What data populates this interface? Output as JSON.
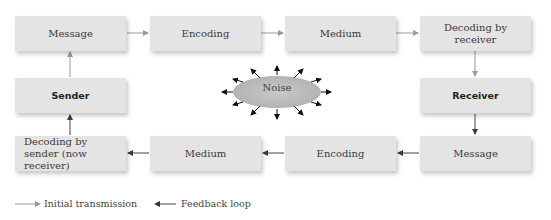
{
  "diagram": {
    "type": "communication-process-flow",
    "row1": [
      {
        "label": "Message",
        "bold": false
      },
      {
        "label": "Encoding",
        "bold": false
      },
      {
        "label": "Medium",
        "bold": false
      },
      {
        "label": "Decoding by receiver",
        "bold": false
      }
    ],
    "row2": {
      "sender": {
        "label": "Sender",
        "bold": true
      },
      "receiver": {
        "label": "Receiver",
        "bold": true
      }
    },
    "row3": [
      {
        "label": "Decoding by sender (now receiver)",
        "bold": false
      },
      {
        "label": "Medium",
        "bold": false
      },
      {
        "label": "Encoding",
        "bold": false
      },
      {
        "label": "Message",
        "bold": false
      }
    ],
    "noise": {
      "label": "Noise"
    },
    "legend": {
      "initial": "Initial transmission",
      "feedback": "Feedback loop"
    },
    "colors": {
      "box_fill": "#e4e4e4",
      "initial_arrow": "#9a9a9a",
      "feedback_arrow": "#444444",
      "noise_fill": "#bdbdbd"
    }
  }
}
